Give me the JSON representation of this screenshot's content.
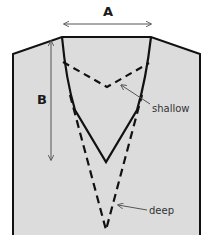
{
  "diagram": {
    "colors": {
      "garment_fill": "#dcdcdc",
      "outline": "#111111",
      "arrow": "#555555"
    },
    "labels": {
      "width": "A",
      "depth": "B",
      "shallow": "shallow",
      "deep": "deep"
    },
    "lines": [
      {
        "name": "shallow",
        "style": "dashed"
      },
      {
        "name": "medium",
        "style": "solid"
      },
      {
        "name": "deep",
        "style": "dashed"
      }
    ]
  }
}
